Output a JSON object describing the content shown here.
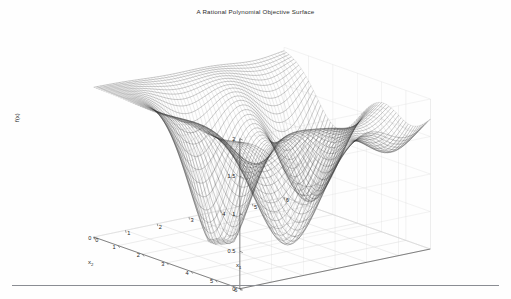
{
  "figure": {
    "title": "A Rational Polynomial Objective Surface",
    "background_color": "#fefefe",
    "rule_color": "#8a8d93",
    "mesh_color": "#303030",
    "grid_color": "#d2d2d2",
    "axis_color": "#3a3a3a",
    "tick_text_color": "#1f1f1f"
  },
  "axes": {
    "x1_label": "x",
    "x1_sub": "1",
    "x2_label": "x",
    "x2_sub": "2",
    "z_label": "f(x)",
    "x1_ticks": [
      "0",
      "1",
      "2",
      "3",
      "4",
      "5",
      "6"
    ],
    "x2_ticks": [
      "0",
      "1",
      "2",
      "3",
      "4",
      "5",
      "6"
    ],
    "z_ticks": [
      "0",
      "0.5",
      "1",
      "1.5",
      "2"
    ]
  },
  "chart_data": {
    "type": "surface",
    "title": "A Rational Polynomial Objective Surface",
    "xlabel": "x_1",
    "ylabel": "x_2",
    "zlabel": "f(x)",
    "xlim": [
      0,
      6
    ],
    "ylim": [
      0,
      6
    ],
    "zlim": [
      0,
      2
    ],
    "xticks": [
      0,
      1,
      2,
      3,
      4,
      5,
      6
    ],
    "yticks": [
      0,
      1,
      2,
      3,
      4,
      5,
      6
    ],
    "zticks": [
      0,
      0.5,
      1,
      1.5,
      2
    ],
    "grid": true,
    "legend": false,
    "mesh_style": "wireframe-dense",
    "mesh_n": 60,
    "view_azimuth_deg": -37.5,
    "view_elevation_deg": 30,
    "surface_formula": "z = 2 - 2*bump(x1,x2)",
    "surface_basins": [
      {
        "center_x1": 2.2,
        "center_x2": 2.2,
        "depth": 0.05,
        "radius": 1.5
      },
      {
        "center_x1": 2.2,
        "center_x2": 2.2,
        "note": "deep central basin near f~0"
      }
    ],
    "surface_plateaus": [
      {
        "corner": "x1=0,x2=6",
        "value": 2.0
      },
      {
        "corner": "x1=6,x2=0",
        "value": 2.0
      },
      {
        "corner": "x1=6,x2=6",
        "value": 2.0
      }
    ]
  }
}
